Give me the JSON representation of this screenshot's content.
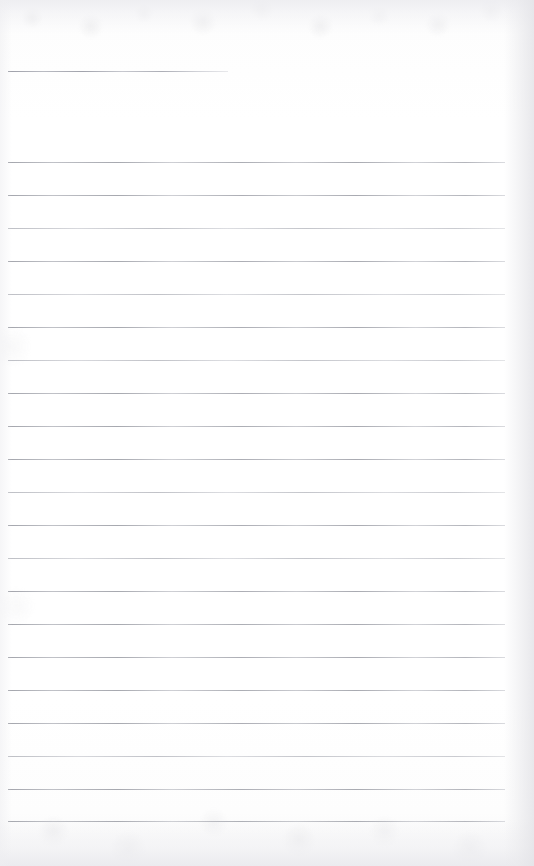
{
  "document": {
    "type": "scanned-lined-paper",
    "title": "",
    "page_width": 534,
    "page_height": 866,
    "background_color": "#fefefe",
    "rule_color": "#9a9ca4",
    "edge_shadow_color": "#e4e4e8",
    "text_content": "",
    "notes": ""
  },
  "rules": {
    "left_x": 8,
    "right_x": 505,
    "spacing": 32.95,
    "count_full": 21,
    "header_rule": {
      "y": 71,
      "left_x": 8,
      "right_x": 228,
      "label": "header-rule"
    },
    "lines": [
      {
        "y": 161.5,
        "x1": 8,
        "x2": 505,
        "weight": "normal"
      },
      {
        "y": 194.5,
        "x1": 8,
        "x2": 505,
        "weight": "normal"
      },
      {
        "y": 227.5,
        "x1": 8,
        "x2": 505,
        "weight": "soft"
      },
      {
        "y": 260.5,
        "x1": 8,
        "x2": 505,
        "weight": "normal"
      },
      {
        "y": 293.5,
        "x1": 8,
        "x2": 505,
        "weight": "soft"
      },
      {
        "y": 326.5,
        "x1": 8,
        "x2": 505,
        "weight": "normal"
      },
      {
        "y": 359.5,
        "x1": 8,
        "x2": 505,
        "weight": "soft"
      },
      {
        "y": 392.5,
        "x1": 8,
        "x2": 505,
        "weight": "normal"
      },
      {
        "y": 425.5,
        "x1": 8,
        "x2": 505,
        "weight": "normal"
      },
      {
        "y": 458.5,
        "x1": 8,
        "x2": 505,
        "weight": "normal"
      },
      {
        "y": 491.5,
        "x1": 8,
        "x2": 505,
        "weight": "soft"
      },
      {
        "y": 524.5,
        "x1": 8,
        "x2": 505,
        "weight": "normal"
      },
      {
        "y": 557.5,
        "x1": 8,
        "x2": 505,
        "weight": "soft"
      },
      {
        "y": 590.5,
        "x1": 8,
        "x2": 505,
        "weight": "normal"
      },
      {
        "y": 623.5,
        "x1": 8,
        "x2": 505,
        "weight": "normal"
      },
      {
        "y": 656.5,
        "x1": 8,
        "x2": 505,
        "weight": "normal"
      },
      {
        "y": 689.5,
        "x1": 8,
        "x2": 505,
        "weight": "normal"
      },
      {
        "y": 722.5,
        "x1": 8,
        "x2": 505,
        "weight": "normal"
      },
      {
        "y": 755.5,
        "x1": 8,
        "x2": 505,
        "weight": "soft"
      },
      {
        "y": 788.5,
        "x1": 8,
        "x2": 505,
        "weight": "normal"
      },
      {
        "y": 821.0,
        "x1": 8,
        "x2": 505,
        "weight": "normal"
      }
    ]
  }
}
